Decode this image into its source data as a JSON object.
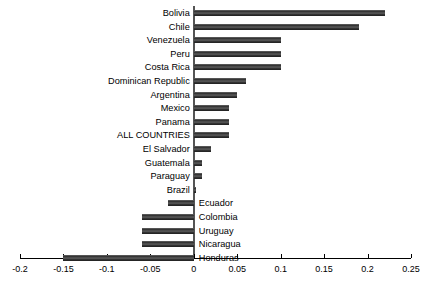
{
  "chart_data": {
    "type": "bar",
    "orientation": "horizontal",
    "title": "",
    "subtitle": "",
    "xlabel": "",
    "ylabel": "",
    "xlim": [
      -0.2,
      0.25
    ],
    "grid": false,
    "legend": null,
    "xticks": [
      "-0.2",
      "-0.15",
      "-0.1",
      "-0.05",
      "0",
      "0.05",
      "0.1",
      "0.15",
      "0.2",
      "0.25"
    ],
    "xtick_values": [
      -0.2,
      -0.15,
      -0.1,
      -0.05,
      0,
      0.05,
      0.1,
      0.15,
      0.2,
      0.25
    ],
    "categories": [
      "Bolivia",
      "Chile",
      "Venezuela",
      "Peru",
      "Costa Rica",
      "Dominican Republic",
      "Argentina",
      "Mexico",
      "Panama",
      "ALL COUNTRIES",
      "El Salvador",
      "Guatemala",
      "Paraguay",
      "Brazil",
      "Ecuador",
      "Colombia",
      "Uruguay",
      "Nicaragua",
      "Honduras"
    ],
    "values": [
      0.22,
      0.19,
      0.1,
      0.1,
      0.1,
      0.06,
      0.05,
      0.04,
      0.04,
      0.04,
      0.02,
      0.009,
      0.009,
      0.002,
      -0.03,
      -0.06,
      -0.06,
      -0.06,
      -0.15
    ],
    "bar_color": "#3a3a3a",
    "axis_color": "#000000"
  }
}
